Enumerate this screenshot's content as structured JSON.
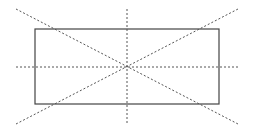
{
  "diagram": {
    "type": "geometric-construction",
    "canvas": {
      "width": 255,
      "height": 137,
      "background": "#ffffff"
    },
    "rectangle": {
      "x": 35,
      "y": 29,
      "width": 184,
      "height": 75,
      "stroke": "#444444",
      "stroke_width": 1.2
    },
    "center": {
      "x": 127,
      "y": 67
    },
    "guides": {
      "stroke": "#555555",
      "stroke_width": 1,
      "dash": "2,2",
      "vertical": {
        "x": 127,
        "y1": 9,
        "y2": 124
      },
      "horizontal": {
        "y": 67,
        "x1": 16,
        "x2": 238
      },
      "diagonal_down": {
        "x1": 16,
        "y1": 9,
        "x2": 238,
        "y2": 124
      },
      "diagonal_up": {
        "x1": 16,
        "y1": 124,
        "x2": 238,
        "y2": 9
      }
    }
  }
}
